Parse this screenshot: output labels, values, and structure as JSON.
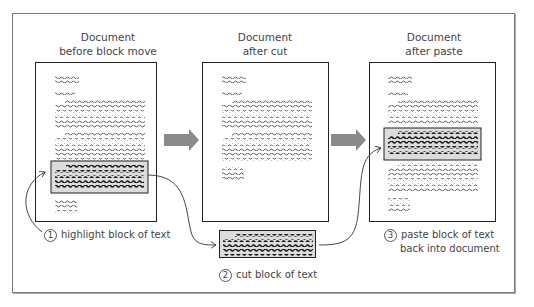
{
  "panels": [
    {
      "title_line1": "Document",
      "title_line2": "before block move"
    },
    {
      "title_line1": "Document",
      "title_line2": "after cut"
    },
    {
      "title_line1": "Document",
      "title_line2": "after paste"
    }
  ],
  "steps": [
    {
      "number": "1",
      "label": "highlight block of text"
    },
    {
      "number": "2",
      "label": "cut block of text"
    },
    {
      "number": "3",
      "label_line1": "paste block of text",
      "label_line2": "back into document"
    }
  ],
  "colors": {
    "highlight_fill": "#dcdcdc",
    "arrow_fill": "#8a8a8a",
    "border": "#222222"
  }
}
